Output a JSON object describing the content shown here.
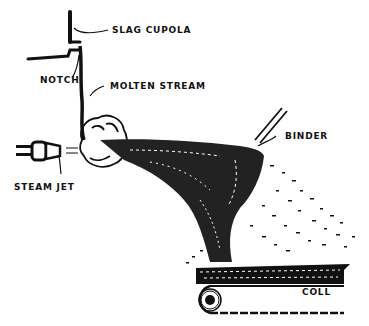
{
  "diagram": {
    "type": "process-illustration",
    "labels": {
      "slag_cupola": "SLAG CUPOLA",
      "notch": "NOTCH",
      "molten_stream": "MOLTEN STREAM",
      "steam_jet": "STEAM JET",
      "binder": "BINDER",
      "coll": "COLL"
    },
    "colors": {
      "ink": "#111111",
      "paper": "#ffffff"
    }
  }
}
